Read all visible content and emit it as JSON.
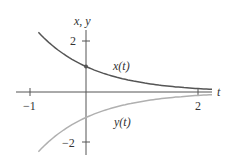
{
  "chart_data": {
    "type": "line",
    "title": "",
    "xlabel": "t",
    "ylabel": "x, y",
    "xlim": [
      -0.85,
      2.25
    ],
    "ylim": [
      -2.4,
      2.4
    ],
    "x_ticks": [
      -1,
      2
    ],
    "x_tick_labels": [
      "−1",
      "2"
    ],
    "y_ticks": [
      2,
      -2
    ],
    "y_tick_labels": [
      "2",
      "−2"
    ],
    "grid": false,
    "series": [
      {
        "name": "x(t)",
        "formula": "e^(-t)",
        "color": "#555555",
        "x": [
          -0.85,
          -0.5,
          0,
          0.5,
          1,
          1.5,
          2,
          2.25
        ],
        "y": [
          2.34,
          1.65,
          1.0,
          0.61,
          0.37,
          0.22,
          0.14,
          0.11
        ]
      },
      {
        "name": "y(t)",
        "formula": "-e^(-t)",
        "color": "#aaaaaa",
        "x": [
          -0.85,
          -0.5,
          0,
          0.5,
          1,
          1.5,
          2,
          2.25
        ],
        "y": [
          -2.34,
          -1.65,
          -1.0,
          -0.61,
          -0.37,
          -0.22,
          -0.14,
          -0.11
        ]
      }
    ],
    "annotations": [
      {
        "text": "x(t)",
        "at": [
          0.5,
          1.0
        ]
      },
      {
        "text": "y(t)",
        "at": [
          0.55,
          -1.1
        ]
      },
      {
        "text": "point",
        "at": [
          0,
          1
        ]
      }
    ],
    "legend": "none (inline labels)"
  },
  "labels": {
    "yaxis": "x, y",
    "xaxis": "t",
    "tick_x_neg1": "−1",
    "tick_x_2": "2",
    "tick_y_2": "2",
    "tick_y_neg2": "−2",
    "curve_x": "x(t)",
    "curve_y": "y(t)"
  }
}
